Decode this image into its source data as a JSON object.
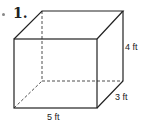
{
  "problem": {
    "number": "1.",
    "shape": "rectangular prism"
  },
  "dimensions": {
    "height": "4 ft",
    "depth": "3 ft",
    "width": "5 ft"
  },
  "style": {
    "stroke": "#222222",
    "hidden_edge": "dashed"
  }
}
